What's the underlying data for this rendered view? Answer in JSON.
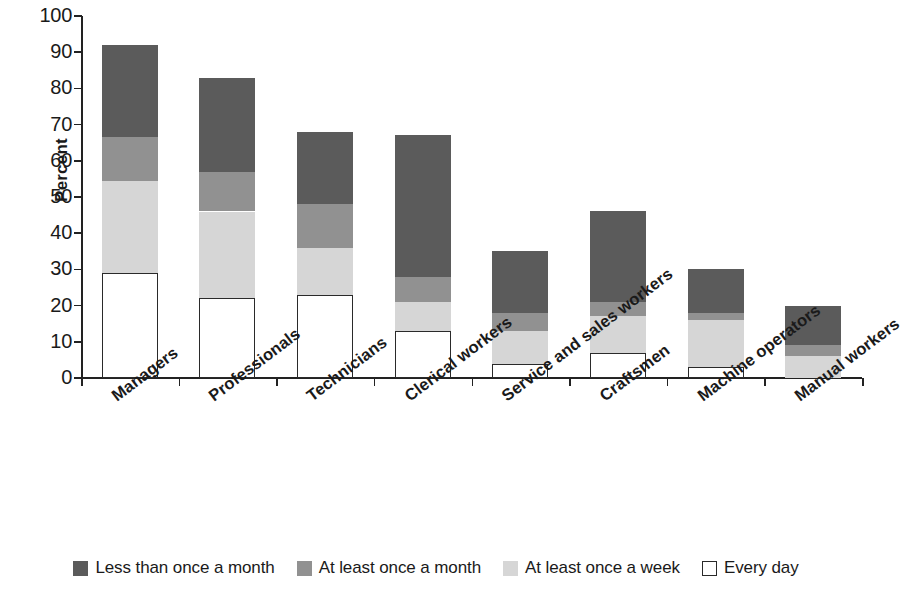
{
  "chart_data": {
    "type": "bar",
    "stacked": true,
    "title": "",
    "xlabel": "",
    "ylabel": "Percent",
    "ylim": [
      0,
      100
    ],
    "y_ticks": [
      0,
      10,
      20,
      30,
      40,
      50,
      60,
      70,
      80,
      90,
      100
    ],
    "grid": false,
    "legend_position": "bottom",
    "categories": [
      "Managers",
      "Professionals",
      "Technicians",
      "Clerical workers",
      "Service and sales workers",
      "Craftsmen",
      "Machine operators",
      "Manual workers"
    ],
    "series": [
      {
        "name": "Every day",
        "color": "#ffffff",
        "values": [
          29,
          22,
          23,
          13,
          4,
          7,
          3,
          0
        ]
      },
      {
        "name": "At least once a week",
        "color": "#d6d6d6",
        "values": [
          25.5,
          24,
          13,
          8,
          9,
          10,
          13,
          6
        ]
      },
      {
        "name": "At least once a month",
        "color": "#919191",
        "values": [
          12,
          11,
          12,
          7,
          5,
          4,
          2,
          3
        ]
      },
      {
        "name": "Less than once a month",
        "color": "#5b5b5b",
        "values": [
          25.5,
          26,
          20,
          39,
          17,
          25,
          12,
          11
        ]
      }
    ],
    "totals": [
      92,
      83,
      68,
      67,
      35,
      46,
      30,
      20
    ],
    "legend_order": [
      "Less than once a month",
      "At least once a month",
      "At least once a week",
      "Every day"
    ],
    "colors": {
      "less_than_once_a_month": "#5b5b5b",
      "at_least_once_a_month": "#919191",
      "at_least_once_a_week": "#d6d6d6",
      "every_day": "#ffffff",
      "axis": "#222222",
      "background": "#ffffff"
    }
  },
  "legend": {
    "items": [
      {
        "label": "Less than once a month",
        "swatch": "swatch-dark-gray"
      },
      {
        "label": "At least once a month",
        "swatch": "swatch-medium-gray"
      },
      {
        "label": "At least once a week",
        "swatch": "swatch-light-gray"
      },
      {
        "label": "Every day",
        "swatch": "swatch-white-outline"
      }
    ]
  },
  "axes": {
    "y_title": "Percent",
    "y_tick_labels": [
      "100",
      "90",
      "80",
      "70",
      "60",
      "50",
      "40",
      "30",
      "20",
      "10",
      "0"
    ]
  }
}
